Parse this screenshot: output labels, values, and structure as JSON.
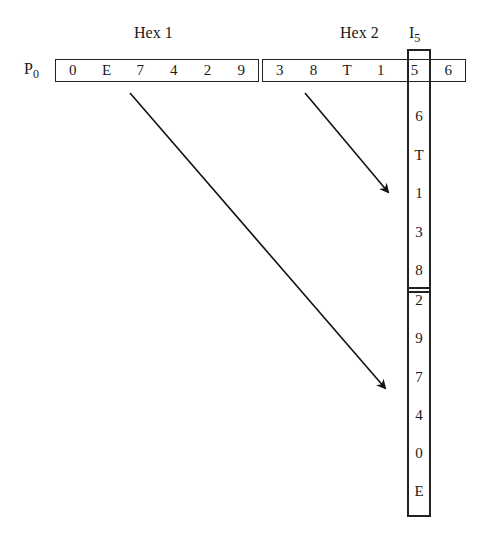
{
  "labels": {
    "hex1": "Hex 1",
    "hex2": "Hex 2",
    "i_label": "I",
    "i_sub": "5",
    "p_label": "P",
    "p_sub": "0"
  },
  "hex1": [
    "0",
    "E",
    "7",
    "4",
    "2",
    "9"
  ],
  "hex2": [
    "3",
    "8",
    "T",
    "1",
    "5",
    "6"
  ],
  "column_top": [
    "6",
    "T",
    "1",
    "3",
    "8"
  ],
  "column_bottom": [
    "2",
    "9",
    "7",
    "4",
    "0",
    "E"
  ]
}
